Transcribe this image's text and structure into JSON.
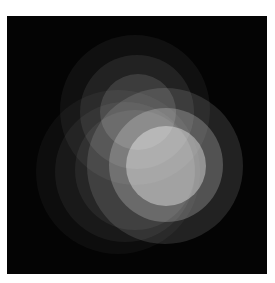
{
  "image": {
    "description": "Abstract graphic of overlapping translucent white circles on a black square",
    "background_color": "#040404",
    "page_color": "#ffffff",
    "frame": {
      "x": 7,
      "y": 16,
      "width": 260,
      "height": 258
    }
  },
  "circles": [
    {
      "name": "left-outer",
      "cx": 118,
      "cy": 172,
      "r": 82,
      "opacity": 0.04
    },
    {
      "name": "left-mid",
      "cx": 125,
      "cy": 172,
      "r": 70,
      "opacity": 0.05
    },
    {
      "name": "left-inner",
      "cx": 135,
      "cy": 170,
      "r": 60,
      "opacity": 0.06
    },
    {
      "name": "top-outer",
      "cx": 135,
      "cy": 110,
      "r": 75,
      "opacity": 0.05
    },
    {
      "name": "top-mid",
      "cx": 137,
      "cy": 112,
      "r": 57,
      "opacity": 0.08
    },
    {
      "name": "top-inner",
      "cx": 138,
      "cy": 112,
      "r": 38,
      "opacity": 0.12
    },
    {
      "name": "main-outer",
      "cx": 165,
      "cy": 166,
      "r": 78,
      "opacity": 0.12
    },
    {
      "name": "main-mid",
      "cx": 166,
      "cy": 165,
      "r": 57,
      "opacity": 0.22
    },
    {
      "name": "main-inner",
      "cx": 166,
      "cy": 166,
      "r": 40,
      "opacity": 0.38
    }
  ]
}
